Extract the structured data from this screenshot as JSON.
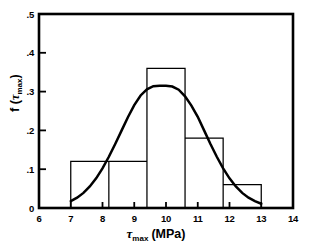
{
  "chart_data": {
    "type": "bar",
    "title": "",
    "subtitle": "",
    "xlabel": "τmax (MPa)",
    "ylabel": "f (τmax)",
    "xlim": [
      6,
      14
    ],
    "ylim": [
      0,
      0.5
    ],
    "grid": false,
    "legend": "none",
    "xticks": [
      6,
      7,
      8,
      9,
      10,
      11,
      12,
      13,
      14
    ],
    "xtick_labels": [
      "6",
      "7",
      "8",
      "9",
      "10",
      "11",
      "12",
      "13",
      "14"
    ],
    "yticks": [
      0,
      0.1,
      0.2,
      0.3,
      0.4,
      0.5
    ],
    "ytick_labels": [
      "0",
      ".1",
      ".2",
      ".3",
      ".4",
      ".5"
    ],
    "bin_edges": [
      7.0,
      8.2,
      9.4,
      10.6,
      11.8,
      13.0
    ],
    "values": [
      0.12,
      0.12,
      0.36,
      0.18,
      0.06
    ],
    "bin_labels": [
      "7.0–8.2",
      "8.2–9.4",
      "9.4–10.6",
      "10.6–11.8",
      "11.8–13.0"
    ],
    "series": [
      {
        "name": "histogram",
        "type": "bar",
        "values": [
          0.12,
          0.12,
          0.36,
          0.18,
          0.06
        ]
      },
      {
        "name": "fitted normal density",
        "type": "line",
        "mean": 10.0,
        "std": 1.26,
        "peak_value": 0.315,
        "peak_x": 10.0,
        "x": [
          7.0,
          7.2,
          7.4,
          7.6,
          7.8,
          8.0,
          8.2,
          8.4,
          8.6,
          8.8,
          9.0,
          9.2,
          9.4,
          9.6,
          9.8,
          10.0,
          10.2,
          10.4,
          10.6,
          10.8,
          11.0,
          11.2,
          11.4,
          11.6,
          11.8,
          12.0,
          12.2,
          12.4,
          12.6,
          12.8,
          13.0
        ],
        "values": [
          0.0175,
          0.0265,
          0.039,
          0.0555,
          0.0765,
          0.102,
          0.132,
          0.165,
          0.1995,
          0.234,
          0.265,
          0.29,
          0.306,
          0.314,
          0.315,
          0.315,
          0.313,
          0.305,
          0.288,
          0.264,
          0.235,
          0.2,
          0.165,
          0.132,
          0.102,
          0.0765,
          0.0555,
          0.039,
          0.0265,
          0.0175,
          0.011
        ]
      }
    ]
  },
  "axis": {
    "x_title_symbol": "τ",
    "x_title_sub": "max",
    "x_title_unit": "(MPa)",
    "y_title_f": "f (",
    "y_title_symbol": "τ",
    "y_title_sub": "max",
    "y_title_close": ")"
  },
  "colors": {
    "frame": "#000000",
    "bars": "#000000",
    "curve": "#000000",
    "background": "#ffffff"
  }
}
